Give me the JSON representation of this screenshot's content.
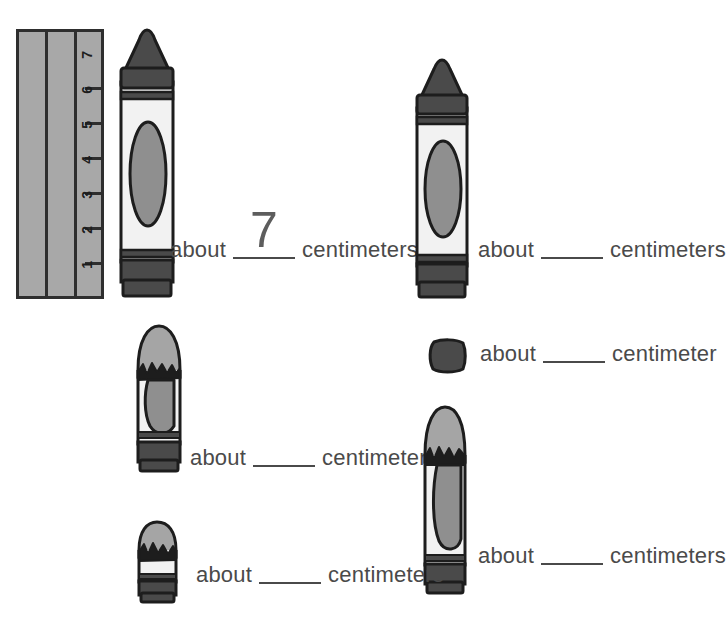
{
  "worksheet": {
    "type": "measurement-practice",
    "unit_word_plural": "centimeters",
    "unit_word_singular": "centimeter",
    "prompt_word": "about"
  },
  "ruler": {
    "name": "centimeter-ruler",
    "orientation": "vertical",
    "tick_labels": [
      "1",
      "2",
      "3",
      "4",
      "5",
      "6",
      "7"
    ],
    "max": 7,
    "body_color": "#a8a8a8",
    "line_color": "#2e2e2e"
  },
  "colors": {
    "crayon_dark": "#4a4a4a",
    "crayon_tip_dark": "#3f3f3f",
    "label_light": "#f2f2f2",
    "oval_gray": "#8f8f8f",
    "wax_gray": "#a5a5a5",
    "outline": "#1d1d1d",
    "text": "#4a4a4a"
  },
  "items": [
    {
      "id": "item-1",
      "crayon_name": "crayon-full-tall-left",
      "measured": true,
      "answer": "7",
      "prompt": "about",
      "unit": "centimeters"
    },
    {
      "id": "item-2",
      "crayon_name": "crayon-full-tall-right",
      "measured": false,
      "answer": "",
      "prompt": "about",
      "unit": "centimeters"
    },
    {
      "id": "item-3",
      "crayon_name": "crayon-worn-medium-left",
      "measured": false,
      "answer": "",
      "prompt": "about",
      "unit": "centimeters"
    },
    {
      "id": "item-4",
      "crayon_name": "crayon-stub-tiny-right",
      "measured": false,
      "answer": "",
      "prompt": "about",
      "unit": "centimeter"
    },
    {
      "id": "item-5",
      "crayon_name": "crayon-worn-tall-right",
      "measured": false,
      "answer": "",
      "prompt": "about",
      "unit": "centimeters"
    },
    {
      "id": "item-6",
      "crayon_name": "crayon-stub-short-left",
      "measured": false,
      "answer": "",
      "prompt": "about",
      "unit": "centimeters"
    }
  ]
}
